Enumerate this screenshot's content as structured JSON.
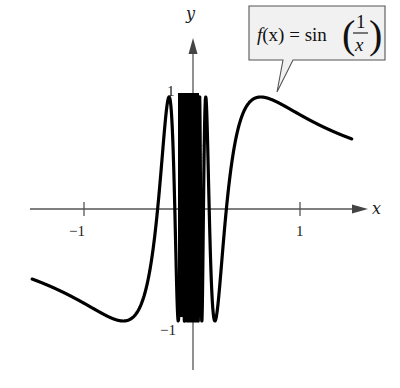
{
  "chart_data": {
    "type": "line",
    "title": "",
    "function": "sin(1/x)",
    "annotation": {
      "prefix": "f(x) = sin",
      "numerator": "1",
      "denominator": "x",
      "full_text": "f(x) = sin(1/x)"
    },
    "xlabel": "x",
    "ylabel": "y",
    "xlim": [
      -1.5,
      1.6
    ],
    "ylim": [
      -1.45,
      1.5
    ],
    "x_ticks": [
      -1,
      1
    ],
    "x_tick_labels": [
      "-1",
      "1"
    ],
    "y_ticks": [
      1,
      -1
    ],
    "y_tick_labels": [
      "1",
      "-1"
    ],
    "grid": false,
    "legend": "none",
    "series": [
      {
        "name": "f(x) = sin(1/x)",
        "x_range": [
          -1.5,
          1.5
        ],
        "note": "oscillates infinitely between -1 and 1 as x approaches 0"
      }
    ],
    "key_points": [
      {
        "label": "local max near x≈0.64",
        "x": 0.637,
        "y": 1
      },
      {
        "label": "local min near x≈-0.64",
        "x": -0.637,
        "y": -1
      },
      {
        "label": "zero crossing",
        "x": 0.318,
        "y": 0
      },
      {
        "label": "zero crossing",
        "x": -0.318,
        "y": 0
      }
    ]
  },
  "labels": {
    "x_axis": "x",
    "y_axis": "y",
    "tick_neg1_x": "−1",
    "tick_pos1_x": "1",
    "tick_pos1_y": "1",
    "tick_neg1_y": "−1",
    "callout_prefix_f": "f",
    "callout_prefix_rest": "(x) = sin",
    "callout_num": "1",
    "callout_den": "x"
  },
  "colors": {
    "curve": "#000000",
    "axes": "#555555",
    "callout_fill": "#f1f1f1",
    "callout_stroke": "#555555"
  }
}
